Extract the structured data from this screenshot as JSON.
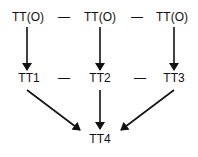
{
  "diagram": {
    "top_row": [
      {
        "label": "TT(O)"
      },
      {
        "label": "TT(O)"
      },
      {
        "label": "TT(O)"
      }
    ],
    "top_separators": [
      "—",
      "—"
    ],
    "middle_row": [
      {
        "label": "TT1"
      },
      {
        "label": "TT2"
      },
      {
        "label": "TT3"
      }
    ],
    "middle_separators": [
      "—",
      "—"
    ],
    "bottom": {
      "label": "TT4"
    },
    "edges": [
      {
        "from": "TT(O) left",
        "to": "TT1"
      },
      {
        "from": "TT(O) center",
        "to": "TT2"
      },
      {
        "from": "TT(O) right",
        "to": "TT3"
      },
      {
        "from": "TT1",
        "to": "TT4"
      },
      {
        "from": "TT2",
        "to": "TT4"
      },
      {
        "from": "TT3",
        "to": "TT4"
      }
    ],
    "colors": {
      "line": "#111111",
      "text": "#111111",
      "background": "#ffffff"
    }
  }
}
